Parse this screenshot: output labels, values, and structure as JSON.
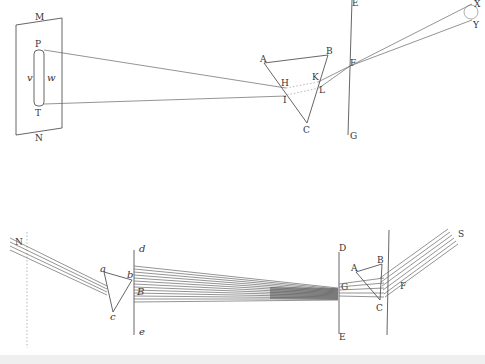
{
  "figure1": {
    "title": "Prism refraction onto screen",
    "screen_labels": {
      "top": "M",
      "bottom": "N"
    },
    "spectrum_labels": {
      "top": "P",
      "bottom": "T",
      "left": "v",
      "right": "w"
    },
    "prism_labels": {
      "a": "A",
      "b": "B",
      "c": "C",
      "h": "H",
      "i": "I",
      "k": "K",
      "l": "L"
    },
    "window_labels": {
      "top": "E",
      "bottom": "G",
      "hole": "F"
    },
    "source_labels": {
      "upper": "X",
      "lower": "Y"
    }
  },
  "figure2": {
    "title": "Recombination of rays by two prisms",
    "source_label": "N",
    "first_prism_labels": {
      "a": "a",
      "b": "b",
      "c": "c"
    },
    "lens_line_labels": {
      "top": "d",
      "bottom": "e",
      "mid": "B"
    },
    "second_prism_labels": {
      "a": "A",
      "b": "B",
      "c": "C"
    },
    "screen_labels": {
      "top": "D",
      "bottom": "E",
      "focus": "G"
    },
    "exit_labels": {
      "hole": "F",
      "source": "S"
    }
  }
}
